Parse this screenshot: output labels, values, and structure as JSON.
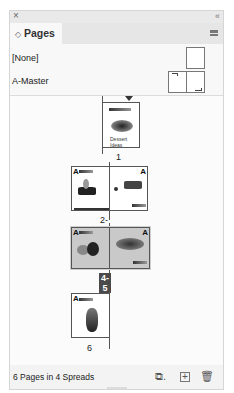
{
  "panel": {
    "close_glyph": "×",
    "collapse_glyph": "‹‹",
    "tab_label": "Pages",
    "tab_arrows": "◇"
  },
  "masters": [
    {
      "label": "[None]"
    },
    {
      "label": "A-Master"
    }
  ],
  "spreads": [
    {
      "label": "1",
      "selected": false,
      "first_page_caption": "Dessert Ideas",
      "master_prefix": "A"
    },
    {
      "label": "2-3",
      "selected": false,
      "master_prefix": "A"
    },
    {
      "label": "4-5",
      "selected": true,
      "master_prefix": "A"
    },
    {
      "label": "6",
      "selected": false,
      "master_prefix": "A"
    }
  ],
  "footer": {
    "status": "6 Pages in 4 Spreads",
    "icons": [
      "edit-page-size-icon",
      "new-page-icon",
      "delete-page-icon"
    ]
  }
}
